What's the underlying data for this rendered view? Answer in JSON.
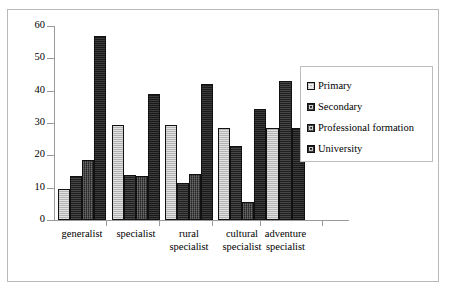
{
  "chart_data": {
    "type": "bar",
    "title": "",
    "subtitle": "",
    "xlabel": "",
    "ylabel": "",
    "ylim": [
      0,
      60
    ],
    "yticks": [
      0,
      10,
      20,
      30,
      40,
      50,
      60
    ],
    "grid": false,
    "legend_position": "right",
    "categories": [
      "generalist",
      "specialist",
      "rural specialist",
      "cultural specialist",
      "adventure specialist"
    ],
    "category_lines": [
      [
        "generalist"
      ],
      [
        "specialist"
      ],
      [
        "rural",
        "specialist"
      ],
      [
        "cultural",
        "specialist"
      ],
      [
        "adventure",
        "specialist"
      ]
    ],
    "series": [
      {
        "name": "Primary",
        "color": "#bdbdbd",
        "values": [
          9.5,
          29.5,
          29.3,
          28.6,
          28.6
        ]
      },
      {
        "name": "Secondary",
        "color": "#2b2b2b",
        "values": [
          13.6,
          14.0,
          11.3,
          22.8,
          43.0
        ]
      },
      {
        "name": "Professional formation",
        "color": "#3a3a3a",
        "values": [
          18.6,
          13.6,
          14.2,
          5.7,
          43.0
        ]
      },
      {
        "name": "University",
        "color": "#252525",
        "values": [
          57.0,
          39.0,
          42.0,
          34.3,
          28.6
        ]
      }
    ]
  },
  "legend": {
    "items": [
      {
        "label": "Primary"
      },
      {
        "label": "Secondary"
      },
      {
        "label": "Professional formation"
      },
      {
        "label": "University"
      }
    ]
  },
  "axis": {
    "y_tick_labels": [
      "60",
      "50",
      "40",
      "30",
      "20",
      "10",
      "0"
    ]
  }
}
